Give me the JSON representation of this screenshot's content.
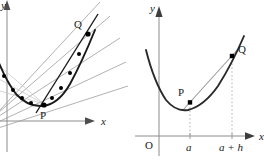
{
  "figure": {
    "background_color": "#ffffff",
    "curve_color": "#1a1a1a",
    "secant_color": "#8c8c8c",
    "axis_color": "#8c8c8c",
    "point_color": "#000000",
    "dotted_color": "#b0b0b0",
    "width": 264,
    "height": 165
  },
  "left_panel": {
    "name": "secant-fan-diagram",
    "axes": {
      "x_label": "x",
      "y_label": "y",
      "x_axis_y": 121,
      "y_axis_x": 7,
      "x_arrow_tip_x": 92
    },
    "points": [
      {
        "id": "P",
        "label": "P",
        "x": 44,
        "y": 104
      },
      {
        "id": "Q",
        "label": "Q",
        "x": 88,
        "y": 34
      }
    ],
    "curve": {
      "description": "parabola with vertex near P",
      "vertex_x": 40,
      "vertex_y": 106
    },
    "secant_points_right": [
      {
        "x": 52,
        "y": 96
      },
      {
        "x": 61,
        "y": 84
      },
      {
        "x": 70,
        "y": 68
      },
      {
        "x": 79,
        "y": 51
      },
      {
        "x": 88,
        "y": 34
      }
    ],
    "secant_points_left": [
      {
        "x": 32,
        "y": 101
      },
      {
        "x": 23,
        "y": 93
      },
      {
        "x": 14,
        "y": 81
      },
      {
        "x": 5,
        "y": 66
      }
    ],
    "secant_lines": 5,
    "tangent_shown": true
  },
  "right_panel": {
    "name": "single-secant-diagram",
    "axes": {
      "x_label": "x",
      "y_label": "y",
      "origin_label": "O",
      "x_axis_y": 136,
      "y_axis_x": 27,
      "x_arrow_tip_x": 120,
      "y_arrow_tip_y": 14
    },
    "ticks": [
      {
        "label": "a",
        "x": 58
      },
      {
        "label": "a + h",
        "x": 100
      }
    ],
    "points": [
      {
        "id": "P",
        "label": "P",
        "x": 58,
        "y": 101
      },
      {
        "id": "Q",
        "label": "Q",
        "x": 100,
        "y": 55
      }
    ],
    "curve": {
      "description": "parabola, minimum left of P",
      "vertex_x": 47,
      "vertex_y": 108
    },
    "secant_line": {
      "from": "P",
      "to": "Q",
      "extended": true
    },
    "dotted_verticals": [
      {
        "from_point": "P",
        "x": 58
      },
      {
        "from_point": "Q",
        "x": 100
      }
    ]
  }
}
